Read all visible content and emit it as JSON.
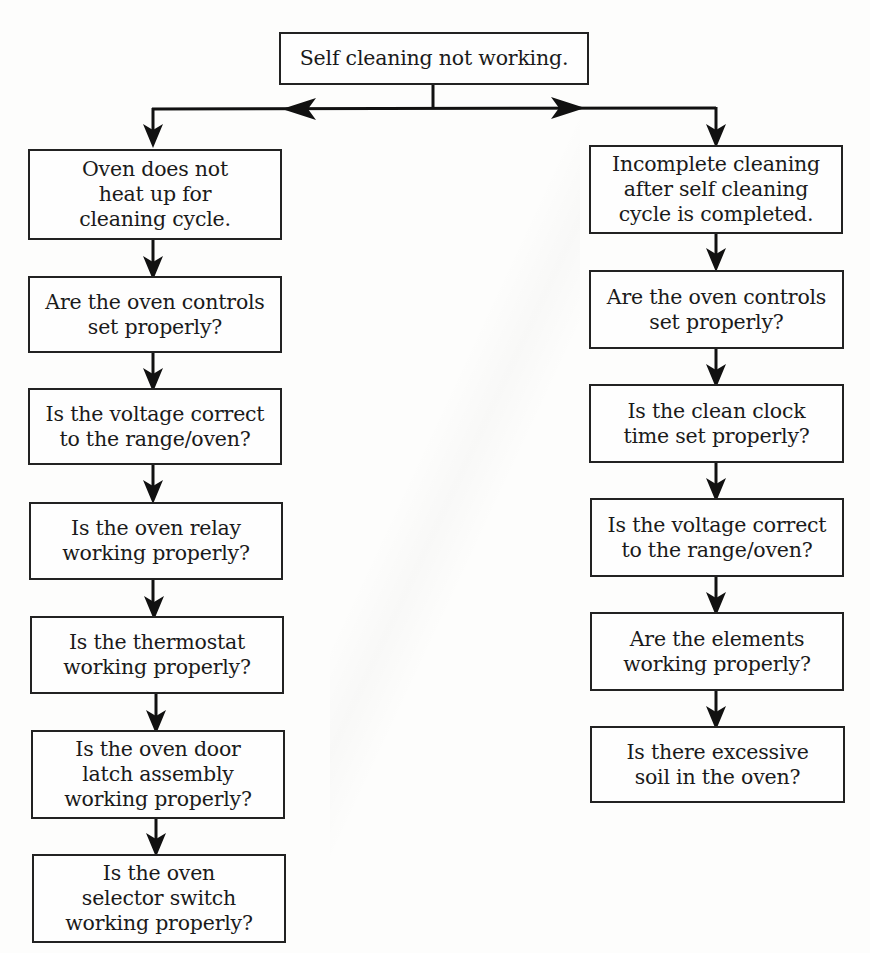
{
  "flowchart": {
    "root": {
      "label": "Self cleaning not working."
    },
    "left_branch": {
      "title": "Oven does not\nheat up for\ncleaning cycle.",
      "steps": [
        "Are the oven controls\nset properly?",
        "Is the voltage correct\nto the range/oven?",
        "Is the oven relay\nworking properly?",
        "Is the thermostat\nworking properly?",
        "Is the oven door\nlatch assembly\nworking properly?",
        "Is the oven\nselector switch\nworking properly?"
      ]
    },
    "right_branch": {
      "title": "Incomplete cleaning\nafter self cleaning\ncycle is completed.",
      "steps": [
        "Are the oven controls\nset properly?",
        "Is the clean clock\ntime set properly?",
        "Is the voltage correct\nto the range/oven?",
        "Are the elements\nworking properly?",
        "Is there excessive\nsoil in the oven?"
      ]
    }
  },
  "colors": {
    "line": "#111111",
    "box_border": "#222222",
    "background": "#fdfdfc"
  }
}
